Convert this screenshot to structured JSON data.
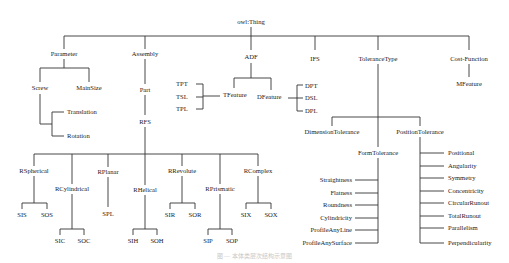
{
  "diagram": {
    "root": "owl:Thing",
    "level1": [
      "Parameter",
      "Assembly",
      "ADF",
      "IFS",
      "ToleranceType",
      "Cost-Function"
    ],
    "parameter": {
      "children": [
        "Screw",
        "MainSize"
      ],
      "screw_children": [
        "Translation",
        "Rotation"
      ]
    },
    "assembly": {
      "child": "Part",
      "part_child": "RFS",
      "rfs_children": [
        "RSpherical",
        "RCylindrical",
        "RPlanar",
        "RHelical",
        "RRevolute",
        "RPrismatic",
        "RComplex"
      ],
      "leaves": {
        "RSpherical": [
          "SIS",
          "SOS"
        ],
        "RCylindrical": [
          "SIC",
          "SOC"
        ],
        "RPlanar": [
          "SPL"
        ],
        "RHelical": [
          "SIH",
          "SOH"
        ],
        "RRevolute": [
          "SIR",
          "SOR"
        ],
        "RPrismatic": [
          "SIP",
          "SOP"
        ],
        "RComplex": [
          "SIX",
          "SOX"
        ]
      }
    },
    "adf": {
      "children": [
        "TFeature",
        "DFeature"
      ],
      "tfeature_children": [
        "TPT",
        "TSL",
        "TPL"
      ],
      "dfeature_children": [
        "DPT",
        "DSL",
        "DPL"
      ]
    },
    "tolerance_type": {
      "children": [
        "DimensionTolerance",
        "FormTolerance",
        "PositionTolerance"
      ],
      "form_children": [
        "Straightness",
        "Flatness",
        "Roundness",
        "Cylindricity",
        "ProfileAnyLine",
        "ProfileAnySurface"
      ],
      "position_children": [
        "Positional",
        "Angularity",
        "Symmetry",
        "Concentricity",
        "CircularRunout",
        "TotalRunout",
        "Parallelism",
        "Perpendicularity"
      ]
    },
    "cost_function": {
      "child": "MFeature"
    },
    "caption": "图 — 本体类层次结构示意图"
  }
}
